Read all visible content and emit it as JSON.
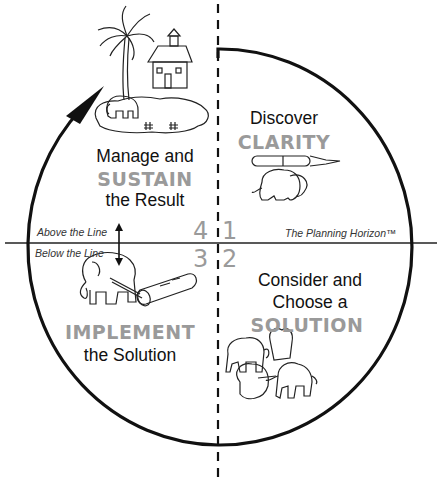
{
  "diagram": {
    "title": "The Planning Horizon™",
    "horizon_label": "The Planning Horizon™",
    "above_label": "Above the Line",
    "below_label": "Below the Line",
    "quadrants": [
      {
        "number": "1",
        "line1": "Discover",
        "emphasis": "CLARITY",
        "illustration": "elephant-carrying-fountain-pen"
      },
      {
        "number": "2",
        "line1": "Consider and",
        "line2": "Choose a",
        "emphasis": "SOLUTION",
        "illustration": "group-of-elephants-meeting"
      },
      {
        "number": "3",
        "emphasis": "IMPLEMENT",
        "line2": "the Solution",
        "illustration": "elephant-pulling-log"
      },
      {
        "number": "4",
        "line1": "Manage and",
        "emphasis": "SUSTAIN",
        "line2": "the Result",
        "illustration": "elephant-on-island-with-house-and-palm-tree"
      }
    ],
    "colors": {
      "line": "#111111",
      "emphasis_text": "#9a9a9a",
      "body_text": "#111111"
    }
  }
}
